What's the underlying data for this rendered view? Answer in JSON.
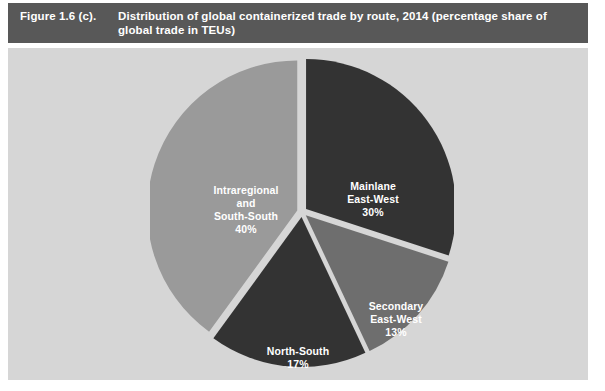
{
  "header": {
    "figure_number": "Figure 1.6 (c).",
    "title": "Distribution of global containerized trade by route, 2014 (percentage share of global trade in TEUs)"
  },
  "colors": {
    "header_bar": "#585858",
    "panel_background": "#d6d6d6",
    "page_background": "#ffffff",
    "label_text": "#ffffff",
    "slice_mainlane_east_west": "#333333",
    "slice_secondary_east_west": "#6e6e6e",
    "slice_north_south": "#333333",
    "slice_intraregional_south_south": "#9a9a9a",
    "slice_gap": "#d6d6d6"
  },
  "chart_data": {
    "type": "pie",
    "title": "Distribution of global containerized trade by route, 2014 (percentage share of global trade in TEUs)",
    "xlabel": "",
    "ylabel": "",
    "units": "percentage share of global trade in TEUs",
    "year": 2014,
    "total": 100,
    "legend": "none (labels drawn inside slices)",
    "grid": false,
    "exploded": true,
    "start_angle_deg": 0,
    "direction": "clockwise",
    "categories": [
      "Mainlane East-West",
      "Secondary East-West",
      "North-South",
      "Intraregional and South-South"
    ],
    "values": [
      30,
      13,
      17,
      40
    ],
    "slices": [
      {
        "name": "Mainlane East-West",
        "label_lines": [
          "Mainlane",
          "East-West",
          "30%"
        ],
        "value": 30,
        "value_label": "30%",
        "color": "#333333"
      },
      {
        "name": "Secondary East-West",
        "label_lines": [
          "Secondary",
          "East-West",
          "13%"
        ],
        "value": 13,
        "value_label": "13%",
        "color": "#6e6e6e"
      },
      {
        "name": "North-South",
        "label_lines": [
          "North-South",
          "17%"
        ],
        "value": 17,
        "value_label": "17%",
        "color": "#333333"
      },
      {
        "name": "Intraregional and South-South",
        "label_lines": [
          "Intraregional",
          "and",
          "South-South",
          "40%"
        ],
        "value": 40,
        "value_label": "40%",
        "color": "#9a9a9a"
      }
    ]
  },
  "labels": {
    "mainlane_l1": "Mainlane",
    "mainlane_l2": "East-West",
    "mainlane_l3": "30%",
    "secondary_l1": "Secondary",
    "secondary_l2": "East-West",
    "secondary_l3": "13%",
    "north_south_l1": "North-South",
    "north_south_l2": "17%",
    "intraregional_l1": "Intraregional",
    "intraregional_l2": "and",
    "intraregional_l3": "South-South",
    "intraregional_l4": "40%"
  }
}
